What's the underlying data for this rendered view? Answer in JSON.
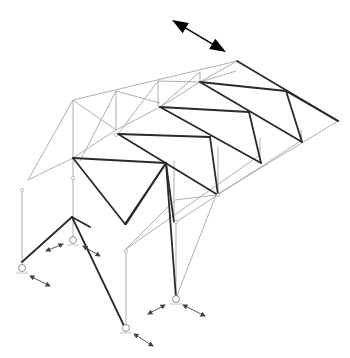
{
  "figure": {
    "type": "structural truss diagram (isometric, space frame roof with supports)",
    "width": 350,
    "height": 358,
    "colors": {
      "thin": "#9a9a9a",
      "thick": "#2a2a2a",
      "arrow": "#000000"
    },
    "thin_lines": [
      [
        73,
        100,
        237,
        61
      ],
      [
        73,
        100,
        28,
        180
      ],
      [
        73,
        100,
        73,
        158
      ],
      [
        73,
        100,
        116,
        130
      ],
      [
        116,
        91,
        116,
        130
      ],
      [
        116,
        91,
        80,
        161
      ],
      [
        116,
        91,
        160,
        103
      ],
      [
        158,
        81,
        158,
        107
      ],
      [
        158,
        81,
        118,
        134
      ],
      [
        158,
        81,
        200,
        82
      ],
      [
        200,
        72,
        200,
        82
      ],
      [
        200,
        72,
        160,
        107
      ],
      [
        237,
        61,
        200,
        82
      ],
      [
        28,
        180,
        73,
        158
      ],
      [
        73,
        158,
        116,
        130
      ],
      [
        116,
        130,
        160,
        107
      ],
      [
        160,
        107,
        200,
        82
      ],
      [
        200,
        82,
        236,
        71
      ],
      [
        22,
        188,
        22,
        268
      ],
      [
        73,
        176,
        73,
        240
      ],
      [
        126,
        249,
        126,
        330
      ],
      [
        176,
        222,
        176,
        298
      ],
      [
        216,
        195,
        176,
        298
      ],
      [
        126,
        249,
        175,
        200
      ],
      [
        175,
        200,
        216,
        195
      ],
      [
        216,
        195,
        338,
        121
      ],
      [
        176,
        222,
        302,
        140
      ],
      [
        126,
        249,
        260,
        155
      ],
      [
        73,
        158,
        73,
        176
      ],
      [
        174,
        161,
        174,
        222
      ],
      [
        218,
        147,
        218,
        195
      ],
      [
        260,
        138,
        260,
        160
      ],
      [
        301,
        130,
        302,
        142
      ]
    ],
    "thick_lines": [
      [
        237,
        61,
        338,
        121
      ],
      [
        200,
        82,
        286,
        91
      ],
      [
        286,
        91,
        338,
        121
      ],
      [
        286,
        91,
        302,
        142
      ],
      [
        200,
        82,
        302,
        142
      ],
      [
        160,
        107,
        249,
        112
      ],
      [
        249,
        112,
        261,
        163
      ],
      [
        160,
        107,
        261,
        163
      ],
      [
        118,
        134,
        210,
        137
      ],
      [
        210,
        137,
        218,
        195
      ],
      [
        118,
        134,
        218,
        195
      ],
      [
        73,
        158,
        166,
        163
      ],
      [
        73,
        158,
        125,
        224
      ],
      [
        166,
        163,
        126,
        224
      ],
      [
        166,
        163,
        174,
        222
      ],
      [
        166,
        163,
        176,
        298
      ],
      [
        72,
        217,
        126,
        330
      ],
      [
        22,
        262,
        72,
        217
      ],
      [
        166,
        163,
        125,
        224
      ],
      [
        72,
        217,
        90,
        227
      ]
    ],
    "supports": [
      {
        "cx": 22,
        "cy": 268,
        "r": 3.5
      },
      {
        "cx": 73,
        "cy": 240,
        "r": 3.5
      },
      {
        "cx": 126,
        "cy": 328,
        "r": 3.5
      },
      {
        "cx": 176,
        "cy": 299,
        "r": 3.5
      }
    ],
    "joints": [
      {
        "cx": 22,
        "cy": 190
      },
      {
        "cx": 73,
        "cy": 178
      },
      {
        "cx": 126,
        "cy": 251
      },
      {
        "cx": 176,
        "cy": 222
      },
      {
        "cx": 218,
        "cy": 195
      },
      {
        "cx": 116,
        "cy": 135
      }
    ],
    "support_arrows": [
      [
        30,
        276,
        50,
        286
      ],
      [
        46,
        251,
        63,
        244
      ],
      [
        83,
        246,
        100,
        256
      ],
      [
        134,
        334,
        153,
        346
      ],
      [
        148,
        314,
        165,
        305
      ],
      [
        183,
        305,
        205,
        316
      ]
    ],
    "main_arrow": {
      "x1": 172,
      "y1": 20,
      "x2": 226,
      "y2": 52
    }
  }
}
